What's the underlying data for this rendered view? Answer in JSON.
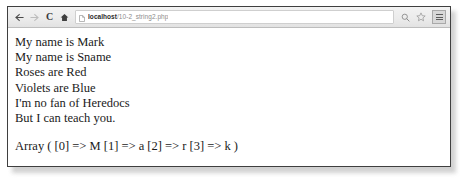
{
  "browser": {
    "nav": {
      "back_label": "Back",
      "forward_label": "Forward",
      "reload_label": "C",
      "home_label": "Home"
    },
    "omnibox": {
      "page_icon_name": "page-document-icon",
      "host": "localhost",
      "path": "/10-2_string2.php",
      "placeholder": "Search Google or type URL"
    },
    "actions": {
      "zoom_label": "Zoom",
      "bookmark_label": "Bookmark this page",
      "menu_label": "Customize and control Google Chrome"
    }
  },
  "document": {
    "lines": [
      "My name is Mark",
      "My name is Sname",
      "Roses are Red",
      "Violets are Blue",
      "I'm no fan of Heredocs",
      "But I can teach you."
    ],
    "array_dump": "Array ( [0] => M [1] => a [2] => r [3] => k )"
  }
}
